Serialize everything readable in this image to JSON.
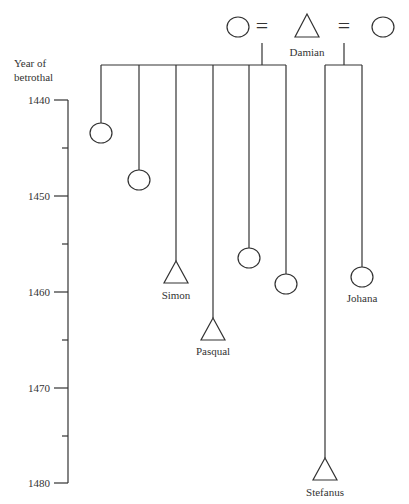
{
  "diagram": {
    "type": "kinship-chart",
    "axis": {
      "title_line1": "Year of",
      "title_line2": "betrothal",
      "ticks": [
        {
          "label": "1440",
          "y": 100
        },
        {
          "label": "1450",
          "y": 196
        },
        {
          "label": "1460",
          "y": 292
        },
        {
          "label": "1470",
          "y": 388
        },
        {
          "label": "1480",
          "y": 483
        }
      ],
      "minor_ticks_y": [
        148,
        244,
        340,
        436
      ]
    },
    "parents": {
      "first_wife": {
        "symbol": "circle",
        "label": ""
      },
      "marriage_sign": "=",
      "father": {
        "symbol": "triangle",
        "label": "Damian"
      },
      "second_wife": {
        "symbol": "circle",
        "label": ""
      }
    },
    "children_first_marriage": [
      {
        "symbol": "circle",
        "label": "",
        "x": 101,
        "y": 133,
        "year": 1443.5
      },
      {
        "symbol": "circle",
        "label": "",
        "x": 139,
        "y": 180,
        "year": 1448.5
      },
      {
        "symbol": "triangle",
        "label": "Simon",
        "x": 176,
        "y": 272,
        "year": 1458
      },
      {
        "symbol": "triangle",
        "label": "Pasqual",
        "x": 213,
        "y": 329,
        "year": 1463
      },
      {
        "symbol": "circle",
        "label": "",
        "x": 249,
        "y": 258,
        "year": 1456.5
      },
      {
        "symbol": "circle",
        "label": "",
        "x": 286,
        "y": 284,
        "year": 1459
      }
    ],
    "children_second_marriage": [
      {
        "symbol": "triangle",
        "label": "Stefanus",
        "x": 325,
        "y": 469,
        "year": 1478.5
      },
      {
        "symbol": "circle",
        "label": "Johana",
        "x": 362,
        "y": 277,
        "year": 1458.5
      }
    ]
  }
}
